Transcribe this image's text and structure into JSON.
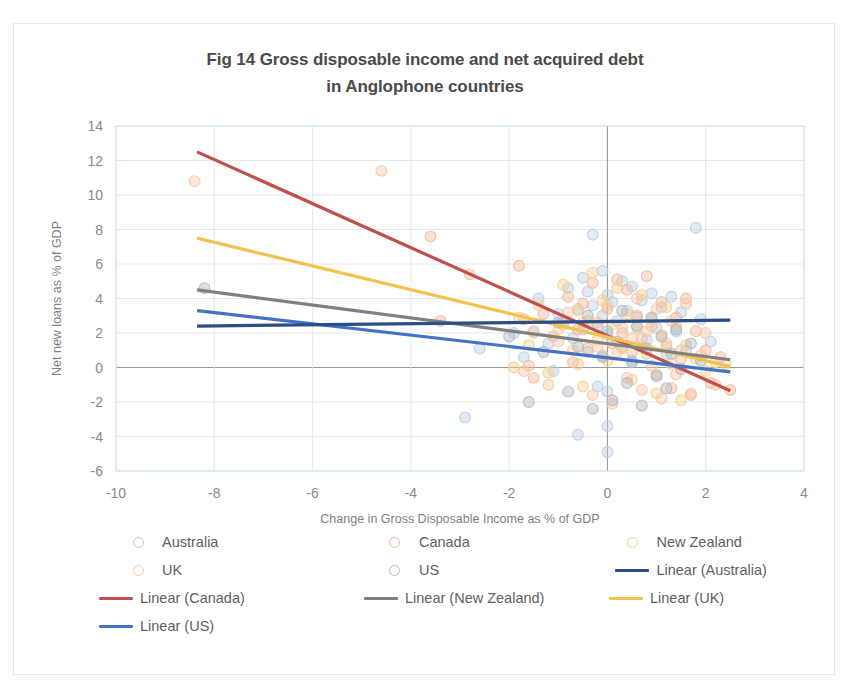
{
  "figure": {
    "title_line1": "Fig 14 Gross disposable income and net acquired debt",
    "title_line2": "in Anglophone countries"
  },
  "legend": {
    "entries": [
      {
        "label": "Australia",
        "type": "marker",
        "color": "#b8cce4"
      },
      {
        "label": "Canada",
        "type": "marker",
        "color": "#f2b896"
      },
      {
        "label": "New Zealand",
        "type": "marker",
        "color": "#f5d08a"
      },
      {
        "label": "UK",
        "type": "marker",
        "color": "#f7c6a3"
      },
      {
        "label": "US",
        "type": "marker",
        "color": "#b0b7bf"
      },
      {
        "label": "Linear (Australia)",
        "type": "line",
        "color": "#2c4d87"
      },
      {
        "label": "Linear (Canada)",
        "type": "line",
        "color": "#c0504d"
      },
      {
        "label": "Linear (New Zealand)",
        "type": "line",
        "color": "#808080"
      },
      {
        "label": "Linear (UK)",
        "type": "line",
        "color": "#f2c14e"
      },
      {
        "label": "Linear (US)",
        "type": "line",
        "color": "#4472c4"
      }
    ]
  },
  "chart_data": {
    "type": "scatter",
    "title": "Fig 14 Gross disposable income and net acquired debt in Anglophone countries",
    "xlabel": "Change in Gross Disposable Income as % of GDP",
    "ylabel": "Net new loans as % of GDP",
    "xlim": [
      -10,
      4
    ],
    "ylim": [
      -6,
      14
    ],
    "xticks": [
      -10,
      -8,
      -6,
      -4,
      -2,
      0,
      2,
      4
    ],
    "yticks": [
      -6,
      -4,
      -2,
      0,
      2,
      4,
      6,
      8,
      10,
      12,
      14
    ],
    "grid": true,
    "legend_position": "bottom",
    "marker_style": "open-circle",
    "series": [
      {
        "name": "Australia",
        "color": "#b8cce4",
        "points": [
          [
            -2.9,
            -2.9
          ],
          [
            -2.6,
            1.1
          ],
          [
            -1.9,
            2.0
          ],
          [
            -1.7,
            0.6
          ],
          [
            -1.5,
            2.1
          ],
          [
            -1.4,
            4.0
          ],
          [
            -1.2,
            1.4
          ],
          [
            -1.1,
            -0.2
          ],
          [
            -1.0,
            3.1
          ],
          [
            -0.9,
            2.6
          ],
          [
            -0.8,
            4.6
          ],
          [
            -0.7,
            1.7
          ],
          [
            -0.6,
            3.4
          ],
          [
            -0.6,
            -3.9
          ],
          [
            -0.5,
            5.2
          ],
          [
            -0.5,
            2.2
          ],
          [
            -0.4,
            4.4
          ],
          [
            -0.4,
            0.9
          ],
          [
            -0.3,
            7.7
          ],
          [
            -0.3,
            3.6
          ],
          [
            -0.2,
            2.4
          ],
          [
            -0.2,
            -1.1
          ],
          [
            -0.1,
            5.6
          ],
          [
            -0.1,
            3.0
          ],
          [
            0.0,
            4.2
          ],
          [
            0.0,
            1.9
          ],
          [
            0.0,
            -1.4
          ],
          [
            0.0,
            -3.4
          ],
          [
            0.0,
            -4.9
          ],
          [
            0.1,
            3.8
          ],
          [
            0.2,
            2.7
          ],
          [
            0.3,
            5.0
          ],
          [
            0.3,
            1.2
          ],
          [
            0.4,
            3.3
          ],
          [
            0.5,
            4.7
          ],
          [
            0.5,
            0.4
          ],
          [
            0.6,
            2.9
          ],
          [
            0.7,
            3.9
          ],
          [
            0.8,
            1.6
          ],
          [
            0.9,
            4.3
          ],
          [
            1.0,
            2.3
          ],
          [
            1.1,
            3.5
          ],
          [
            1.2,
            0.8
          ],
          [
            1.3,
            4.1
          ],
          [
            1.4,
            2.1
          ],
          [
            1.5,
            3.2
          ],
          [
            1.6,
            1.0
          ],
          [
            1.8,
            8.1
          ],
          [
            1.9,
            2.8
          ],
          [
            2.1,
            1.5
          ]
        ]
      },
      {
        "name": "Canada",
        "color": "#f2b896",
        "points": [
          [
            -3.6,
            7.6
          ],
          [
            -3.4,
            2.7
          ],
          [
            -2.8,
            5.4
          ],
          [
            -1.8,
            5.9
          ],
          [
            -1.7,
            2.8
          ],
          [
            -1.6,
            0.1
          ],
          [
            -1.5,
            -0.6
          ],
          [
            -1.3,
            3.1
          ],
          [
            -1.1,
            1.8
          ],
          [
            -0.9,
            2.5
          ],
          [
            -0.8,
            4.1
          ],
          [
            -0.7,
            0.3
          ],
          [
            -0.6,
            2.2
          ],
          [
            -0.5,
            3.7
          ],
          [
            -0.4,
            1.1
          ],
          [
            -0.3,
            4.9
          ],
          [
            -0.2,
            2.6
          ],
          [
            -0.1,
            0.7
          ],
          [
            0.0,
            3.4
          ],
          [
            0.1,
            1.4
          ],
          [
            0.2,
            5.1
          ],
          [
            0.3,
            2.0
          ],
          [
            0.4,
            4.5
          ],
          [
            0.5,
            0.9
          ],
          [
            0.6,
            3.0
          ],
          [
            0.7,
            1.7
          ],
          [
            0.8,
            5.3
          ],
          [
            0.9,
            2.4
          ],
          [
            1.0,
            -0.4
          ],
          [
            1.1,
            3.8
          ],
          [
            1.2,
            1.2
          ],
          [
            1.3,
            -1.2
          ],
          [
            1.4,
            2.9
          ],
          [
            1.5,
            0.5
          ],
          [
            1.6,
            4.0
          ],
          [
            1.7,
            -1.6
          ],
          [
            1.8,
            2.1
          ],
          [
            2.0,
            1.0
          ],
          [
            2.1,
            -0.9
          ],
          [
            2.3,
            0.6
          ],
          [
            2.5,
            -1.3
          ]
        ]
      },
      {
        "name": "New Zealand",
        "color": "#f5d08a",
        "points": [
          [
            -1.9,
            0.0
          ],
          [
            -1.8,
            2.9
          ],
          [
            -1.6,
            1.3
          ],
          [
            -1.4,
            3.6
          ],
          [
            -1.2,
            -0.3
          ],
          [
            -1.0,
            2.2
          ],
          [
            -0.9,
            4.8
          ],
          [
            -0.7,
            1.0
          ],
          [
            -0.6,
            3.3
          ],
          [
            -0.5,
            -1.1
          ],
          [
            -0.4,
            2.7
          ],
          [
            -0.3,
            5.5
          ],
          [
            -0.2,
            1.6
          ],
          [
            -0.1,
            3.9
          ],
          [
            0.0,
            0.4
          ],
          [
            0.1,
            2.5
          ],
          [
            0.2,
            4.6
          ],
          [
            0.3,
            1.1
          ],
          [
            0.4,
            3.1
          ],
          [
            0.5,
            -0.7
          ],
          [
            0.6,
            2.3
          ],
          [
            0.7,
            4.2
          ],
          [
            0.8,
            0.8
          ],
          [
            0.9,
            2.8
          ],
          [
            1.0,
            -1.5
          ],
          [
            1.1,
            1.9
          ],
          [
            1.2,
            3.5
          ],
          [
            1.3,
            0.2
          ],
          [
            1.4,
            2.4
          ],
          [
            1.5,
            -1.9
          ],
          [
            1.6,
            1.3
          ],
          [
            1.8,
            0.5
          ],
          [
            2.0,
            -0.2
          ],
          [
            2.2,
            0.3
          ]
        ]
      },
      {
        "name": "UK",
        "color": "#f7c6a3",
        "points": [
          [
            -8.4,
            10.8
          ],
          [
            -4.6,
            11.4
          ],
          [
            -1.7,
            -0.2
          ],
          [
            -1.5,
            2.0
          ],
          [
            -1.2,
            -1.0
          ],
          [
            -1.0,
            1.5
          ],
          [
            -0.8,
            3.2
          ],
          [
            -0.6,
            0.2
          ],
          [
            -0.5,
            2.6
          ],
          [
            -0.3,
            -1.6
          ],
          [
            -0.2,
            1.2
          ],
          [
            0.0,
            3.6
          ],
          [
            0.1,
            -2.1
          ],
          [
            0.2,
            0.9
          ],
          [
            0.3,
            2.3
          ],
          [
            0.4,
            -0.6
          ],
          [
            0.5,
            1.7
          ],
          [
            0.6,
            4.0
          ],
          [
            0.7,
            -1.3
          ],
          [
            0.8,
            2.1
          ],
          [
            0.9,
            0.1
          ],
          [
            1.0,
            3.4
          ],
          [
            1.1,
            -1.8
          ],
          [
            1.2,
            1.4
          ],
          [
            1.3,
            2.7
          ],
          [
            1.4,
            -0.4
          ],
          [
            1.5,
            1.0
          ],
          [
            1.6,
            3.7
          ],
          [
            1.7,
            -1.5
          ],
          [
            1.9,
            0.7
          ],
          [
            2.0,
            2.0
          ],
          [
            2.2,
            -1.0
          ],
          [
            2.4,
            0.2
          ]
        ]
      },
      {
        "name": "US",
        "color": "#b0b7bf",
        "points": [
          [
            -8.2,
            4.6
          ],
          [
            -2.0,
            1.8
          ],
          [
            -1.6,
            -2.0
          ],
          [
            -1.3,
            0.9
          ],
          [
            -1.0,
            2.6
          ],
          [
            -0.8,
            -1.4
          ],
          [
            -0.6,
            1.2
          ],
          [
            -0.4,
            3.0
          ],
          [
            -0.3,
            -2.4
          ],
          [
            -0.1,
            0.6
          ],
          [
            0.0,
            2.1
          ],
          [
            0.1,
            -1.9
          ],
          [
            0.2,
            1.5
          ],
          [
            0.3,
            3.3
          ],
          [
            0.4,
            -0.9
          ],
          [
            0.5,
            0.3
          ],
          [
            0.6,
            2.4
          ],
          [
            0.7,
            -2.2
          ],
          [
            0.8,
            1.1
          ],
          [
            0.9,
            2.9
          ],
          [
            1.0,
            -0.5
          ],
          [
            1.1,
            1.8
          ],
          [
            1.2,
            -1.2
          ],
          [
            1.3,
            0.8
          ],
          [
            1.4,
            2.2
          ],
          [
            1.5,
            -0.1
          ],
          [
            1.7,
            1.4
          ],
          [
            1.9,
            0.4
          ]
        ]
      }
    ],
    "trendlines": [
      {
        "name": "Linear (Canada)",
        "color": "#c0504d",
        "x1": -8.35,
        "y1": 12.5,
        "x2": 2.5,
        "y2": -1.35
      },
      {
        "name": "Linear (UK)",
        "color": "#f2c14e",
        "x1": -8.35,
        "y1": 7.5,
        "x2": 2.5,
        "y2": 0.05
      },
      {
        "name": "Linear (New Zealand)",
        "color": "#808080",
        "x1": -8.35,
        "y1": 4.5,
        "x2": 2.5,
        "y2": 0.45
      },
      {
        "name": "Linear (US)",
        "color": "#4472c4",
        "x1": -8.35,
        "y1": 3.3,
        "x2": 2.5,
        "y2": -0.25
      },
      {
        "name": "Linear (Australia)",
        "color": "#2c4d87",
        "x1": -8.35,
        "y1": 2.4,
        "x2": 2.5,
        "y2": 2.75
      }
    ]
  }
}
